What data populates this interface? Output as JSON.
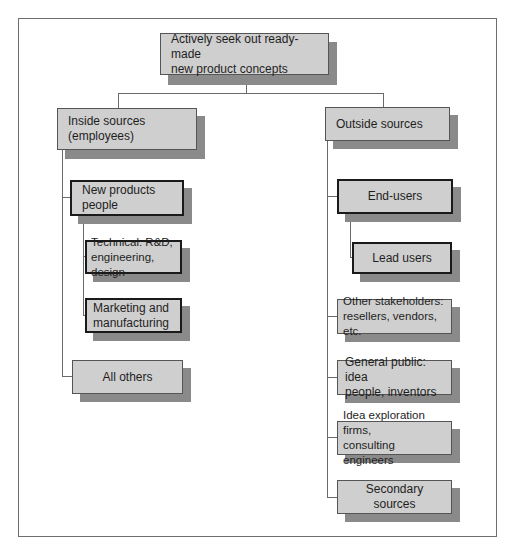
{
  "diagram": {
    "type": "tree",
    "root": {
      "label": "Actively seek out ready-made\nnew  product concepts"
    },
    "inside": {
      "label": "Inside sources\n(employees)",
      "new_products": "New products\npeople",
      "technical": "Technical: R&D,\nengineering, design",
      "marketing": "Marketing and\nmanufacturing",
      "all_others": "All others"
    },
    "outside": {
      "label": "Outside sources",
      "end_users": "End-users",
      "lead_users": "Lead users",
      "stakeholders": "Other stakeholders:\nresellers, vendors, etc.",
      "general_public": "General public: idea\npeople, inventors",
      "idea_firms": "Idea exploration firms,\nconsulting engineers",
      "secondary": "Secondary sources"
    },
    "colors": {
      "box_fill": "#cfcfcf",
      "shadow": "#8a8a8a",
      "line": "#6a6a6a"
    }
  }
}
